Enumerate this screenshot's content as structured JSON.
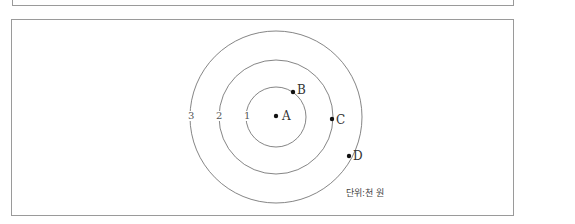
{
  "diagram": {
    "rings": [
      {
        "label": "1"
      },
      {
        "label": "2"
      },
      {
        "label": "3"
      }
    ],
    "points": [
      {
        "label": "A"
      },
      {
        "label": "B"
      },
      {
        "label": "C"
      },
      {
        "label": "D"
      }
    ],
    "unit": "단위:천 원"
  }
}
